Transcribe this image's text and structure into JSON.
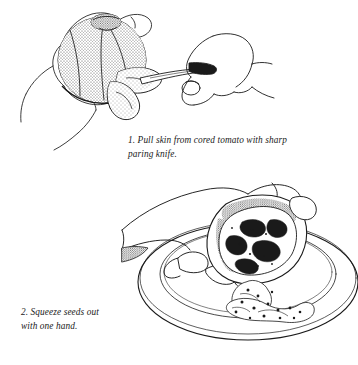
{
  "page": {
    "background_color": "#ffffff",
    "ink_color": "#1a1a1a",
    "width": 358,
    "height": 365,
    "medium": "pen-and-ink line drawing with stipple shading"
  },
  "figures": [
    {
      "id": "figure-1",
      "step_number": "1.",
      "caption": "1. Pull skin from cored tomato with sharp\nparing knife.",
      "caption_text": "Pull skin from cored tomato with sharp paring knife.",
      "subjects": [
        "left-hand-holding-tomato",
        "cored-tomato",
        "tomato-skin-strips",
        "right-hand-holding-knife",
        "paring-knife"
      ]
    },
    {
      "id": "figure-2",
      "step_number": "2.",
      "caption": "2. Squeeze seeds out\nwith one hand.",
      "caption_text": "Squeeze seeds out with one hand.",
      "subjects": [
        "hand-squeezing-tomato-half",
        "halved-tomato",
        "tomato-seeds-and-pulp",
        "dinner-plate"
      ]
    }
  ]
}
